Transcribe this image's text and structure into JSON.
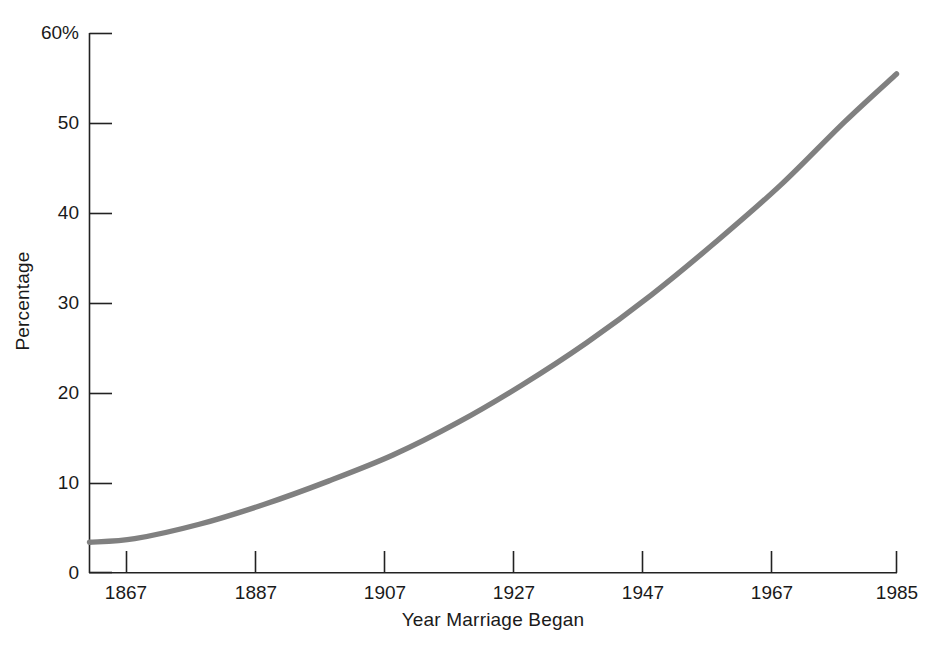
{
  "chart_data": {
    "type": "line",
    "title": "",
    "subtitle": "",
    "xlabel": "Year Marriage Began",
    "ylabel": "Percentage",
    "grid": false,
    "legend": null,
    "xlim": [
      1860,
      1985
    ],
    "ylim": [
      0,
      60
    ],
    "xticks": [
      1867,
      1887,
      1907,
      1927,
      1947,
      1967,
      1985
    ],
    "xtick_labels": [
      "1867",
      "1887",
      "1907",
      "1927",
      "1947",
      "1967",
      "1985"
    ],
    "yticks": [
      0,
      10,
      20,
      30,
      40,
      50,
      60
    ],
    "ytick_labels": [
      "0",
      "10",
      "20",
      "30",
      "40",
      "50",
      "60%"
    ],
    "series": [
      {
        "name": "Percentage",
        "color": "#808080",
        "x": [
          1860,
          1867,
          1877,
          1887,
          1897,
          1907,
          1917,
          1927,
          1937,
          1947,
          1957,
          1967,
          1977,
          1985
        ],
        "values": [
          3.4,
          3.8,
          5.4,
          7.6,
          10.2,
          13.1,
          16.7,
          20.9,
          25.6,
          30.9,
          36.8,
          43.1,
          50.2,
          55.5
        ]
      }
    ]
  },
  "axis": {
    "ytick_0": "0",
    "ytick_10": "10",
    "ytick_20": "20",
    "ytick_30": "30",
    "ytick_40": "40",
    "ytick_50": "50",
    "ytick_60": "60%",
    "xtick_1867": "1867",
    "xtick_1887": "1887",
    "xtick_1907": "1907",
    "xtick_1927": "1927",
    "xtick_1947": "1947",
    "xtick_1967": "1967",
    "xtick_1985": "1985"
  },
  "colors": {
    "line": "#808080",
    "axis": "#222222",
    "background": "#ffffff"
  }
}
